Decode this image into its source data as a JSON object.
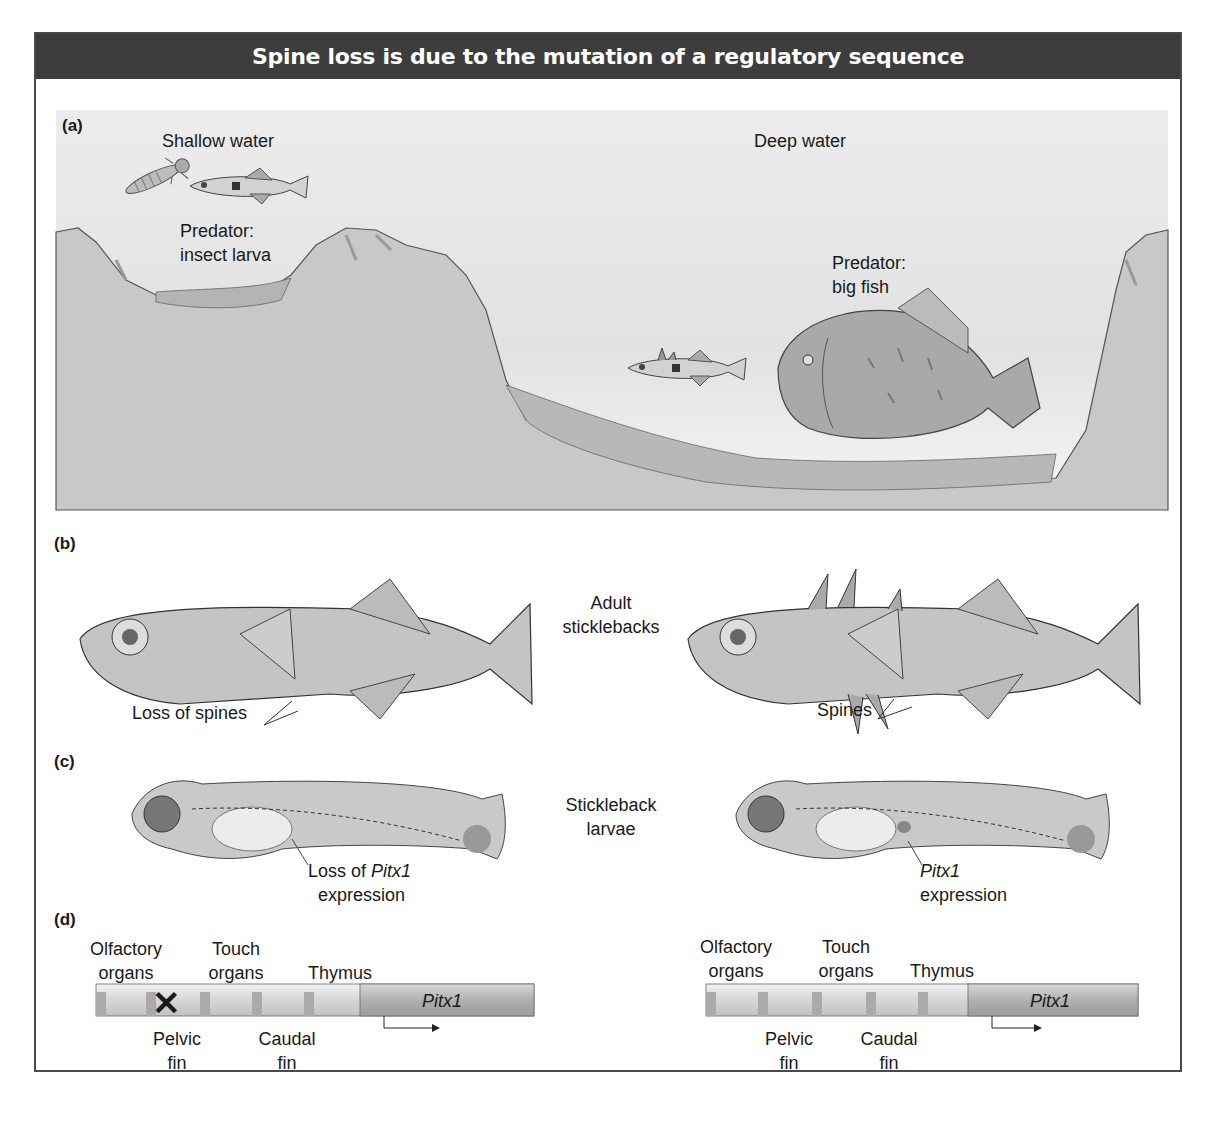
{
  "title": "Spine loss is due to the mutation of a regulatory sequence",
  "colors": {
    "title_bg": "#3d3d3d",
    "title_fg": "#ffffff",
    "water": "#e6e6e6",
    "rock": "#c4c4c4",
    "fish_body": "#bdbdbd"
  },
  "panels": {
    "a": {
      "label": "(a)",
      "shallow": {
        "heading": "Shallow water",
        "predator_line1": "Predator:",
        "predator_line2": "insect larva"
      },
      "deep": {
        "heading": "Deep water",
        "predator_line1": "Predator:",
        "predator_line2": "big fish"
      }
    },
    "b": {
      "label": "(b)",
      "center_line1": "Adult",
      "center_line2": "sticklebacks",
      "left_callout": "Loss of spines",
      "right_callout": "Spines"
    },
    "c": {
      "label": "(c)",
      "center_line1": "Stickleback",
      "center_line2": "larvae",
      "left_callout_prefix": "Loss of ",
      "left_callout_gene": "Pitx1",
      "left_callout_line2": "expression",
      "right_callout_gene": "Pitx1",
      "right_callout_line2": "expression"
    },
    "d": {
      "label": "(d)",
      "gene": "Pitx1",
      "top_labels": [
        {
          "line1": "Olfactory",
          "line2": "organs"
        },
        {
          "line1": "Touch",
          "line2": "organs"
        },
        {
          "line1": "",
          "line2": "Thymus"
        }
      ],
      "bottom_labels": [
        {
          "line1": "Pelvic",
          "line2": "fin"
        },
        {
          "line1": "Caudal",
          "line2": "fin"
        }
      ],
      "left_mutation_mark": "✕"
    }
  }
}
